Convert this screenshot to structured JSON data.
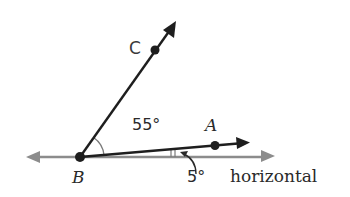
{
  "diagram": {
    "points": {
      "A": {
        "label": "A",
        "x": 215,
        "y": 146
      },
      "B": {
        "label": "B",
        "x": 80,
        "y": 157
      },
      "C": {
        "label": "C",
        "x": 155,
        "y": 50
      }
    },
    "angles": {
      "CBA": {
        "label": "55°"
      },
      "ABH": {
        "label": "5°"
      }
    },
    "horizontal_label": "horizontal",
    "colors": {
      "ray": "#1e1e1e",
      "horizontal": "#8c8c8c",
      "point": "#1e1e1e",
      "arc": "#7a7a7a"
    }
  }
}
